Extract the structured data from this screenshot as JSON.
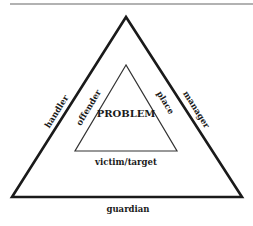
{
  "diagram": {
    "type": "problem-analysis-triangle",
    "center": {
      "label": "PROBLEM"
    },
    "inner_triangle": {
      "left": "offender",
      "right": "place",
      "bottom": "victim/target"
    },
    "outer_triangle": {
      "left": "handler",
      "right": "manager",
      "bottom": "guardian"
    },
    "colors": {
      "line": "#1a1a1a",
      "background": "#ffffff",
      "rule": "#555555"
    }
  }
}
